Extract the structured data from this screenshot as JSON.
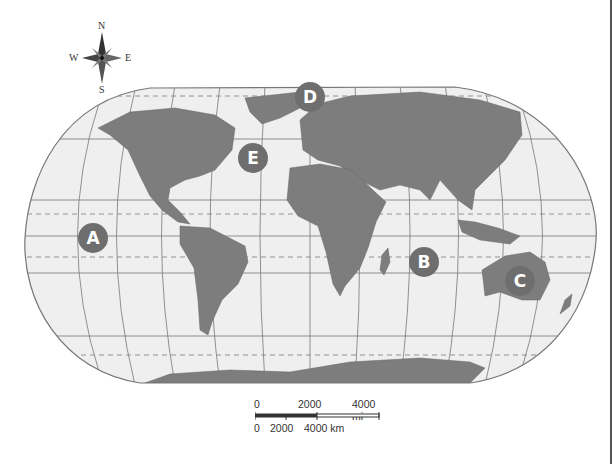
{
  "compass": {
    "n": "N",
    "s": "S",
    "e": "E",
    "w": "W"
  },
  "markers": [
    {
      "label": "A",
      "x": 93,
      "y": 238
    },
    {
      "label": "B",
      "x": 424,
      "y": 262
    },
    {
      "label": "C",
      "x": 520,
      "y": 281
    },
    {
      "label": "D",
      "x": 310,
      "y": 97
    },
    {
      "label": "E",
      "x": 253,
      "y": 158
    }
  ],
  "scale": {
    "mi_labels": [
      "0",
      "2000",
      "4000 mi"
    ],
    "km_labels": [
      "0",
      "2000",
      "4000 km"
    ]
  },
  "colors": {
    "land": "#7d7d7d",
    "ocean": "#efefef",
    "marker": "#6e6e6e",
    "grid": "#777777"
  }
}
